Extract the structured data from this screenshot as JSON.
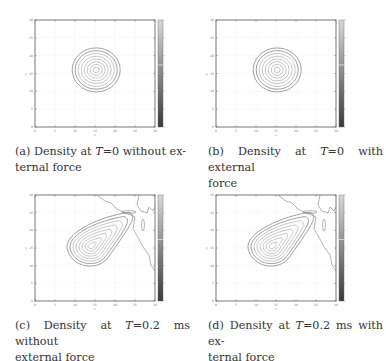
{
  "figure": {
    "panels": [
      {
        "id": "a",
        "caption_prefix": "(a) Density at ",
        "caption_var": "T",
        "caption_suffix": "=0 without ex-",
        "caption_line2": "ternal force",
        "time": "0",
        "external_force": false
      },
      {
        "id": "b",
        "caption_prefix": "(b) Density at ",
        "caption_var": "T",
        "caption_suffix": "=0 with external",
        "caption_line2": "force",
        "time": "0",
        "external_force": true
      },
      {
        "id": "c",
        "caption_prefix": "(c) Density at ",
        "caption_var": "T",
        "caption_suffix": "=0.2 ms without",
        "caption_line2": "external force",
        "time": "0.2 ms",
        "external_force": false
      },
      {
        "id": "d",
        "caption_prefix": "(d) Density at ",
        "caption_var": "T",
        "caption_suffix": "=0.2 ms with ex-",
        "caption_line2": "ternal force",
        "time": "0.2 ms",
        "external_force": true
      }
    ],
    "axes": {
      "xlabel": "x",
      "ylabel": "y",
      "xticks": [
        "0",
        "5",
        "10",
        "15",
        "20",
        "25",
        "30"
      ],
      "yticks": [
        "0",
        "5",
        "10",
        "15",
        "20",
        "25",
        "30"
      ]
    },
    "colorbar": {
      "colormap": "grayscale",
      "top_color": "#d8d8d8",
      "bottom_color": "#3a3a3a",
      "marker_color": "#ffffff"
    }
  },
  "chart_data": [
    {
      "type": "contour",
      "title": "Density at T=0 without external force",
      "xlabel": "x",
      "ylabel": "y",
      "xlim": [
        0,
        30
      ],
      "ylim": [
        0,
        30
      ],
      "grid": true,
      "contour_shape": "concentric circles",
      "center": [
        15,
        16
      ],
      "outer_radius": 6,
      "levels": 8
    },
    {
      "type": "contour",
      "title": "Density at T=0 with external force",
      "xlabel": "x",
      "ylabel": "y",
      "xlim": [
        0,
        30
      ],
      "ylim": [
        0,
        30
      ],
      "grid": true,
      "contour_shape": "concentric circles",
      "center": [
        15,
        16
      ],
      "outer_radius": 6,
      "levels": 8
    },
    {
      "type": "contour",
      "title": "Density at T=0.2 ms without external force",
      "xlabel": "x",
      "ylabel": "y",
      "xlim": [
        0,
        30
      ],
      "ylim": [
        0,
        30
      ],
      "grid": true,
      "contour_shape": "teardrop elongated toward upper right",
      "peak": [
        14,
        15
      ],
      "levels": 8,
      "coastline": "upper right corner"
    },
    {
      "type": "contour",
      "title": "Density at T=0.2 ms with external force",
      "xlabel": "x",
      "ylabel": "y",
      "xlim": [
        0,
        30
      ],
      "ylim": [
        0,
        30
      ],
      "grid": true,
      "contour_shape": "teardrop elongated toward upper right",
      "peak": [
        14,
        15
      ],
      "levels": 8,
      "coastline": "upper right corner"
    }
  ]
}
